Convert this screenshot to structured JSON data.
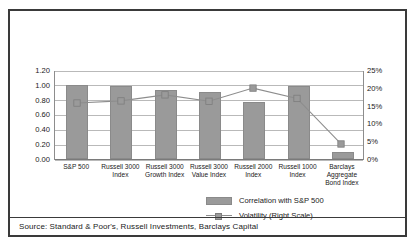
{
  "figure": {
    "source_note": "Source: Standard & Poor's, Russell Investments, Barclays Capital"
  },
  "legend": {
    "bar_label": "Correlation with S&P 500",
    "line_label": "Volatility (Right Scale)"
  },
  "axes": {
    "left_ticks": [
      "1.20",
      "1.00",
      "0.80",
      "0.60",
      "0.40",
      "0.20",
      "0.00"
    ],
    "right_ticks": [
      "25%",
      "20%",
      "15%",
      "10%",
      "5%",
      "0%"
    ]
  },
  "colors": {
    "bar_fill": "#9a9a9a",
    "line": "#8d8d8d",
    "gridline": "#b9b9b9",
    "border": "#3a3a3a",
    "text": "#1a1a1a"
  },
  "chart_data": {
    "type": "bar",
    "title": "",
    "xlabel": "",
    "ylabel": "",
    "categories": [
      "S&P 500",
      "Russell 3000 Index",
      "Russell 3000 Growth Index",
      "Russell 3000 Value Index",
      "Russell 2000 Index",
      "Russell 1000 Index",
      "Barclays Aggregate Bond Index"
    ],
    "category_lines": [
      [
        "S&P 500"
      ],
      [
        "Russell 3000",
        "Index"
      ],
      [
        "Russell 3000",
        "Growth Index"
      ],
      [
        "Russell 3000",
        "Value Index"
      ],
      [
        "Russell 2000",
        "Index"
      ],
      [
        "Russell 1000",
        "Index"
      ],
      [
        "Barclays",
        "Aggregate",
        "Bond Index"
      ]
    ],
    "series": [
      {
        "name": "Correlation with S&P 500",
        "type": "bar",
        "axis": "left",
        "values": [
          1.0,
          0.99,
          0.93,
          0.91,
          0.77,
          0.99,
          0.09
        ]
      },
      {
        "name": "Volatility (Right Scale)",
        "type": "line",
        "axis": "right",
        "values": [
          16.0,
          16.6,
          18.3,
          16.5,
          20.2,
          17.3,
          4.5
        ]
      }
    ],
    "ylim": [
      0,
      1.2
    ],
    "y2lim": [
      0,
      25
    ],
    "ytick_step": 0.2,
    "y2tick_step": 5,
    "grid": true,
    "legend_position": "bottom-right"
  }
}
